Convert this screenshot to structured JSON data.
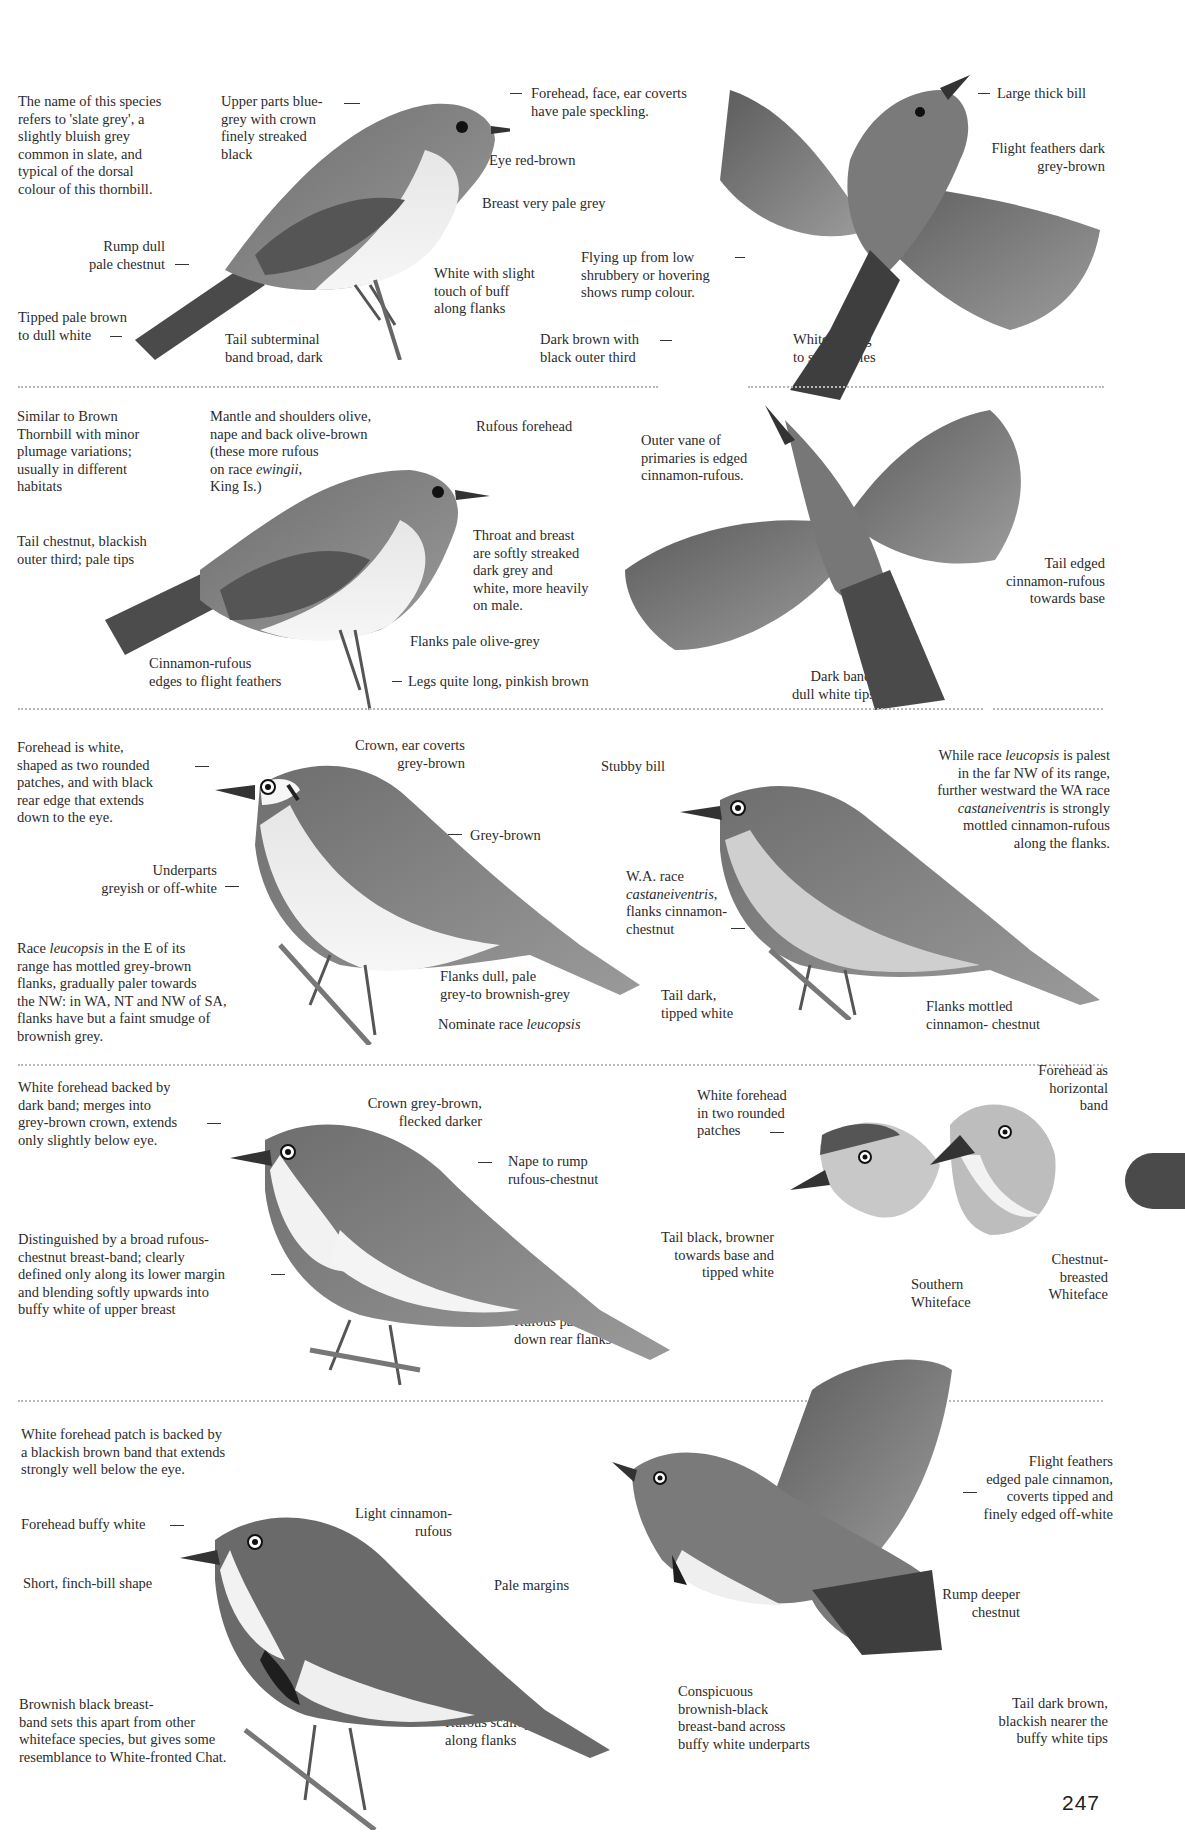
{
  "page": {
    "number": "247",
    "thumb_tab_color": "#4a4a4a",
    "divider_color": "#b8b8b8"
  },
  "plates": [
    {
      "id": "slaty-thornbill-plate",
      "labels": {
        "intro": "The name of this species\nrefers to 'slate grey', a\nslightly bluish grey\ncommon in slate, and\ntypical of the dorsal\ncolour of this thornbill.",
        "upper_parts": "Upper parts blue-\ngrey with crown\nfinely streaked\nblack",
        "forehead": "Forehead, face, ear coverts\nhave pale speckling.",
        "eye": "Eye red-brown",
        "breast": "Breast very pale grey",
        "rump": "Rump dull\npale chestnut",
        "flanks": "White with slight\ntouch of buff\nalong flanks",
        "tail_tip": "Tipped pale brown\nto dull white",
        "tail_band": "Tail subterminal\nband broad, dark",
        "large_bill": "Large thick bill",
        "flight_feathers": "Flight feathers dark\ngrey-brown",
        "flying_up": "Flying up from low\nshrubbery or hovering\nshows rump colour.",
        "dark_brown": "Dark brown with\nblack outer third",
        "white_edging": "White edging\nto secondaries"
      }
    },
    {
      "id": "tasmanian-thornbill-plate",
      "labels": {
        "similar": "Similar to Brown\nThornbill with minor\nplumage variations;\nusually in different\nhabitats",
        "mantle_pre": "Mantle and shoulders olive,\nnape and back olive-brown\n(these more rufous\non race ",
        "mantle_race": "ewingii",
        "mantle_post": ",\nKing Is.)",
        "rufous_forehead": "Rufous forehead",
        "tail_chestnut": "Tail chestnut, blackish\nouter third; pale tips",
        "throat": "Throat and breast\nare softly streaked\ndark grey and\nwhite, more heavily\non male.",
        "cinnamon_edges": "Cinnamon-rufous\nedges to flight feathers",
        "flanks": "Flanks pale olive-grey",
        "legs": "Legs quite long, pinkish brown",
        "outer_vane": "Outer vane of\nprimaries is edged\ncinnamon-rufous.",
        "tail_edged": "Tail edged\ncinnamon-rufous\ntowards base",
        "dark_band": "Dark band,\ndull white tips"
      }
    },
    {
      "id": "southern-whiteface-plate",
      "labels": {
        "forehead": "Forehead is white,\nshaped as two rounded\npatches, and with black\nrear edge that extends\ndown to the eye.",
        "crown": "Crown, ear coverts\ngrey-brown",
        "stubby_bill": "Stubby bill",
        "grey_brown": "Grey-brown",
        "underparts": "Underparts\ngreyish or off-white",
        "race_note_pre": "Race ",
        "race_note_race": "leucopsis",
        "race_note_post": " in the E of its\nrange has mottled grey-brown\nflanks, gradually paler towards\nthe NW: in WA, NT and NW of SA,\nflanks have but a faint smudge of\nbrownish grey.",
        "flanks_dull": "Flanks dull, pale\ngrey-to brownish-grey",
        "nominate_pre": "Nominate race ",
        "nominate_race": "leucopsis",
        "wa_race_pre": "W.A. race\n",
        "wa_race_name": "castaneiventris",
        "wa_race_post": ",\nflanks cinnamon-\nchestnut",
        "tail_dark": "Tail dark,\ntipped white",
        "flanks_mottled": "Flanks mottled\ncinnamon- chestnut",
        "while_race_1": "While race ",
        "while_race_name1": "leucopsis",
        "while_race_2": " is palest\nin the far NW of its range,\nfurther westward the WA race\n",
        "while_race_name2": "castaneiventris",
        "while_race_3": " is strongly\nmottled cinnamon-rufous\nalong the flanks."
      }
    },
    {
      "id": "chestnut-breasted-whiteface-plate",
      "labels": {
        "white_forehead": "White forehead backed by\ndark band; merges into\ngrey-brown crown, extends\nonly slightly below eye.",
        "crown": "Crown grey-brown,\nflecked darker",
        "nape": "Nape to rump\nrufous-chestnut",
        "distinguished": "Distinguished by a broad rufous-\nchestnut breast-band; clearly\ndefined only along its lower margin\nand blending softly upwards into\nbuffy white of upper breast",
        "tail_black": "Tail black, browner\ntowards base and\ntipped white",
        "rufous_patch": "Rufous patch\ndown rear flanks",
        "white_forehead_two": "White forehead\nin two rounded\npatches",
        "forehead_band": "Forehead as\nhorizontal\nband",
        "southern_whiteface": "Southern\nWhiteface",
        "chestnut_whiteface": "Chestnut-\nbreasted\nWhiteface"
      }
    },
    {
      "id": "banded-whiteface-plate",
      "labels": {
        "white_patch": "White forehead patch is backed by\na blackish brown band that extends\nstrongly well below the eye.",
        "forehead_buffy": "Forehead buffy white",
        "light_cinnamon": "Light cinnamon-\nrufous",
        "finch_bill": "Short, finch-bill shape",
        "pale_margins": "Pale margins",
        "brownish_band": "Brownish black breast-\nband sets this apart from other\nwhiteface species, but gives some\nresemblance to White-fronted Chat.",
        "rufous_scallopings": "Rufous scallopings\nalong flanks",
        "conspicuous": "Conspicuous\nbrownish-black\nbreast-band across\nbuffy white underparts",
        "flight_feathers": "Flight feathers\nedged pale cinnamon,\ncoverts tipped and\nfinely edged off-white",
        "rump_deeper": "Rump deeper\nchestnut",
        "tail_dark_brown": "Tail dark brown,\nblackish nearer the\nbuffy white tips"
      }
    }
  ]
}
